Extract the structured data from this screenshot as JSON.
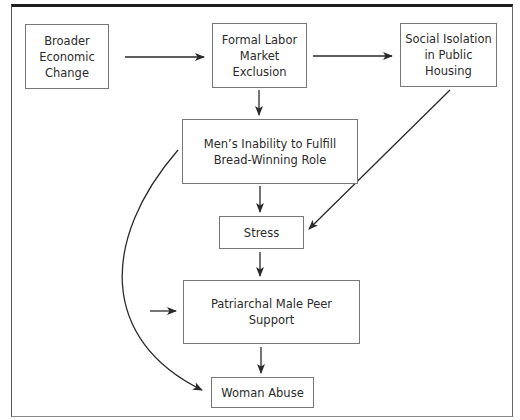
{
  "diagram": {
    "type": "flowchart",
    "nodes": [
      {
        "id": "broader",
        "label": "Broader\nEconomic\nChange"
      },
      {
        "id": "formal",
        "label": "Formal Labor\nMarket\nExclusion"
      },
      {
        "id": "social",
        "label": "Social Isolation\nin Public\nHousing"
      },
      {
        "id": "inability",
        "label": "Men’s Inability to Fulfill\nBread-Winning Role"
      },
      {
        "id": "stress",
        "label": "Stress"
      },
      {
        "id": "patriarchal",
        "label": "Patriarchal Male Peer\nSupport"
      },
      {
        "id": "abuse",
        "label": "Woman Abuse"
      }
    ],
    "edges": [
      {
        "from": "broader",
        "to": "formal"
      },
      {
        "from": "formal",
        "to": "social"
      },
      {
        "from": "formal",
        "to": "inability"
      },
      {
        "from": "inability",
        "to": "stress"
      },
      {
        "from": "social",
        "to": "stress"
      },
      {
        "from": "stress",
        "to": "patriarchal"
      },
      {
        "from": "external",
        "to": "patriarchal"
      },
      {
        "from": "patriarchal",
        "to": "abuse"
      },
      {
        "from": "inability",
        "to": "abuse",
        "style": "curved"
      }
    ],
    "colors": {
      "line": "#2a2a2a",
      "box_border": "#777777",
      "frame_top": "#1e1e1e"
    }
  }
}
